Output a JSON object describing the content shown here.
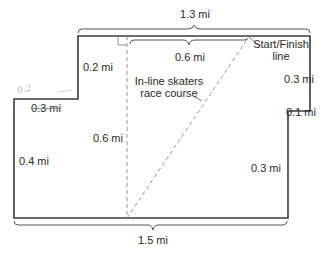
{
  "diagram": {
    "title": "In-line skaters race course",
    "course_label_line1": "In-line skaters",
    "course_label_line2": "race course",
    "start_label_line1": "Start/Finish",
    "start_label_line2": "line",
    "dimensions": {
      "top_total": "1.3 mi",
      "top_inner": "0.6 mi",
      "bottom_total": "1.5 mi",
      "upper_left_step_vertical": "0.2 mi",
      "left_step_horizontal": "0.3 mi",
      "left_side": "0.4 mi",
      "center_dashed_vertical": "0.6 mi",
      "right_upper": "0.3 mi",
      "right_step": "0.1 mi",
      "right_lower": "0.3 mi"
    },
    "handwriting": "0.2",
    "colors": {
      "outline": "#3a3a3a",
      "dashed": "#8a8a8a",
      "text": "#2a2a2a",
      "background": "#ffffff"
    }
  }
}
